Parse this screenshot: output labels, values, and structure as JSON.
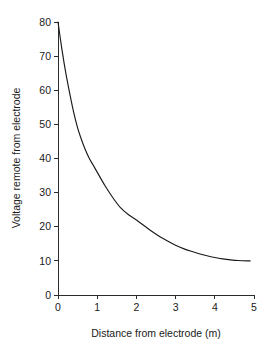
{
  "chart_data": {
    "type": "line",
    "title": "",
    "xlabel": "Distance from electrode (m)",
    "ylabel": "Voltage remote from electrode",
    "xlim": [
      0,
      5
    ],
    "ylim": [
      0,
      80
    ],
    "xticks": [
      0,
      1,
      2,
      3,
      4,
      5
    ],
    "yticks": [
      0,
      10,
      20,
      30,
      40,
      50,
      60,
      70,
      80
    ],
    "xtick_labels": [
      "0",
      "1",
      "2",
      "3",
      "4",
      "5"
    ],
    "ytick_labels": [
      "0",
      "10",
      "20",
      "30",
      "40",
      "50",
      "60",
      "70",
      "80"
    ],
    "grid": false,
    "legend": false,
    "legend_position": "none",
    "line_color": "#1a1a1a",
    "axis_color": "#2b2b2b",
    "background_color": "#ffffff",
    "series": [
      {
        "name": "Voltage remote from electrode",
        "x": [
          0.0,
          0.1,
          0.2,
          0.3,
          0.4,
          0.5,
          0.6,
          0.7,
          0.8,
          0.9,
          1.0,
          1.2,
          1.4,
          1.6,
          1.8,
          2.0,
          2.2,
          2.4,
          2.6,
          2.8,
          3.0,
          3.2,
          3.4,
          3.6,
          3.8,
          4.0,
          4.2,
          4.4,
          4.6,
          4.9
        ],
        "y": [
          80.0,
          72.0,
          65.0,
          59.0,
          53.5,
          49.0,
          45.5,
          42.5,
          40.0,
          38.0,
          36.0,
          32.0,
          28.5,
          25.5,
          23.5,
          22.0,
          20.3,
          18.6,
          17.1,
          15.8,
          14.6,
          13.6,
          12.8,
          12.1,
          11.5,
          11.0,
          10.6,
          10.3,
          10.1,
          10.0
        ]
      }
    ]
  },
  "axes": {
    "x_axis_label": "Distance from electrode (m)",
    "y_axis_label": "Voltage remote from electrode"
  }
}
